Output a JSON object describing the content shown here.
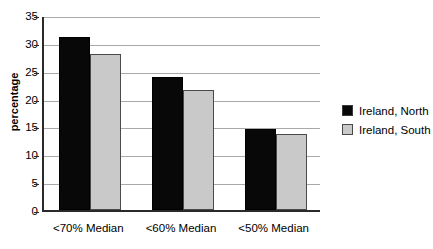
{
  "chart_data": {
    "type": "bar",
    "title": "",
    "xlabel": "",
    "ylabel": "percentage",
    "categories": [
      "<70% Median",
      "<60% Median",
      "<50% Median"
    ],
    "series": [
      {
        "name": "Ireland, North",
        "color": "#080808",
        "values": [
          31.0,
          23.8,
          14.6
        ]
      },
      {
        "name": "Ireland, South",
        "color": "#c9c9c9",
        "values": [
          28.0,
          21.5,
          13.7
        ]
      }
    ],
    "ylim": [
      0,
      35
    ],
    "yticks": [
      0,
      5,
      10,
      15,
      20,
      25,
      30,
      35
    ],
    "ytick_labels": [
      "0",
      "5",
      "10",
      "15",
      "20",
      "25",
      "30",
      "35"
    ],
    "grid": true,
    "legend_position": "right"
  },
  "legend": {
    "entries": [
      {
        "label": "Ireland, North"
      },
      {
        "label": "Ireland, South"
      }
    ]
  }
}
